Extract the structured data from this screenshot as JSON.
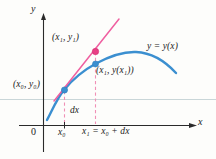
{
  "figure": {
    "kind": "calculus-tangent-line-differential-diagram",
    "axes": {
      "y_axis_label": "y",
      "x_axis_label": "x",
      "origin_label": "0"
    },
    "labels": {
      "tangent_point": "(x₁, y₁)",
      "curve_point": "(x₁, y(x₁))",
      "initial_point": "(x₀, y₀)",
      "curve_name": "y = y(x)",
      "differential": "dx",
      "tick_x0": "x₀",
      "tick_x1_equation": "x₁ = x₀ + dx"
    },
    "colors": {
      "curve": "#3b8fd0",
      "curve_dark": "#2f7cbb",
      "tangent": "#ef5fa0",
      "tangent_light": "#f08fb8",
      "dashed_guide": "#f090b6",
      "point_tangent_fill": "#e83f85",
      "point_curve_fill": "#3b8fd0",
      "axis": "#2a2a2a",
      "text": "#1c1c1c",
      "scan_line": "#c7d4d6",
      "background": "#fdfdfb"
    },
    "geometry": {
      "y_axis_x": 43,
      "x_axis_y": 125,
      "x0_pixel": 64,
      "x1_pixel": 95,
      "point_initial": [
        64,
        90
      ],
      "point_curve": [
        95,
        64
      ],
      "point_tangent": [
        95,
        51
      ],
      "curve_peak": [
        136,
        52
      ]
    }
  }
}
